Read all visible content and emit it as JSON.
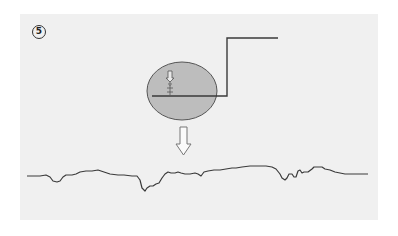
{
  "figure": {
    "step_number": "5",
    "step_label": "⑤",
    "colors": {
      "background": "#ffffff",
      "panel": "#f0f0f0",
      "line": "#404040",
      "ellipse_fill": "#bdbdbd",
      "ellipse_stroke": "#555555",
      "arrow": "#777777"
    },
    "elements": {
      "step_edge": "step-shaped line rising from zoom ellipse",
      "zoom_ellipse": "magnified view of a small object on the surface",
      "down_arrow": "hollow downward arrow indicating transformation",
      "profile_trace": "resulting surface profile trace"
    }
  }
}
